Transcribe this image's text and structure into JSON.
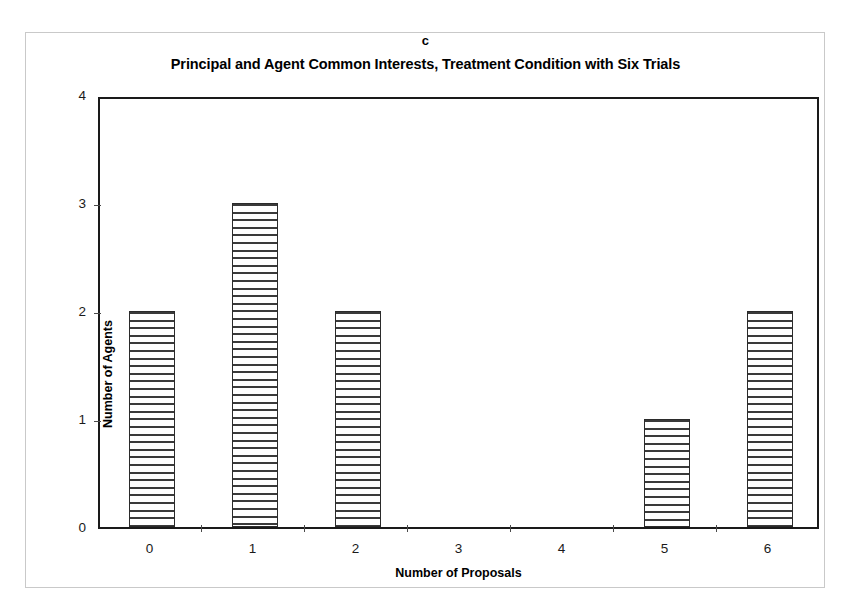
{
  "panel": {
    "letter": "c"
  },
  "chart_data": {
    "type": "bar",
    "title": "Principal and Agent Common Interests, Treatment Condition with Six Trials",
    "xlabel": "Number of Proposals",
    "ylabel": "Number of Agents",
    "categories": [
      "0",
      "1",
      "2",
      "3",
      "4",
      "5",
      "6"
    ],
    "values": [
      2,
      3,
      2,
      0,
      0,
      1,
      2
    ],
    "ylim": [
      0,
      4
    ],
    "yticks": [
      "0",
      "1",
      "2",
      "3",
      "4"
    ],
    "ytick_values": [
      0,
      1,
      2,
      3,
      4
    ],
    "grid": false,
    "legend": false,
    "series": [
      {
        "name": "Number of Agents",
        "values": [
          2,
          3,
          2,
          0,
          0,
          1,
          2
        ]
      }
    ],
    "bar_fill": "horizontal-stripe-hatch",
    "bar_edge_color": "#2b2b2b",
    "frame_color": "#1a1a1a"
  }
}
